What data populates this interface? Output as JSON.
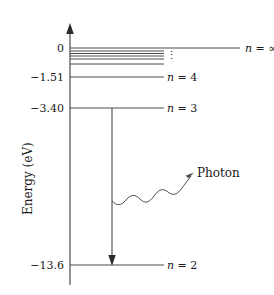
{
  "figure": {
    "type": "energy-level-diagram",
    "axis_title": "Energy (eV)",
    "width": 274,
    "height": 295,
    "line_color": "#4d4d4d",
    "text_color": "#1a1a1a",
    "background": "#ffffff"
  },
  "y_axis": {
    "ticks": [
      {
        "label": "0",
        "value": 0,
        "y": 48
      },
      {
        "label": "−1.51",
        "value": -1.51,
        "y": 77
      },
      {
        "label": "−3.40",
        "value": -3.4,
        "y": 108
      },
      {
        "label": "−13.6",
        "value": -13.6,
        "y": 265
      }
    ]
  },
  "levels": [
    {
      "id": "n-infinity",
      "label": "n = ∞",
      "n": "∞",
      "energy": 0,
      "y": 48,
      "x_end": 240,
      "label_x": 245
    },
    {
      "id": "n-8",
      "label": "",
      "n": 8,
      "energy": -0.21,
      "y": 51,
      "x_end": 164,
      "label_x": null
    },
    {
      "id": "n-7",
      "label": "",
      "n": 7,
      "energy": -0.28,
      "y": 53.5,
      "x_end": 164,
      "label_x": null
    },
    {
      "id": "n-6",
      "label": "",
      "n": 6,
      "energy": -0.38,
      "y": 56,
      "x_end": 164,
      "label_x": null
    },
    {
      "id": "n-5",
      "label": "",
      "n": 5,
      "energy": -0.54,
      "y": 59,
      "x_end": 164,
      "label_x": null
    },
    {
      "id": "n-4",
      "label": "n = 4",
      "n": 4,
      "energy": -0.85,
      "y": 64,
      "x_end": 164,
      "label_x": 167
    },
    {
      "id": "n-3",
      "label": "n = 3",
      "n": 3,
      "energy": -1.51,
      "y": 77,
      "x_end": 164,
      "label_x": 167
    },
    {
      "id": "n-2",
      "label": "n = 2",
      "n": 2,
      "energy": -3.4,
      "y": 108,
      "x_end": 164,
      "label_x": 167
    },
    {
      "id": "n-1",
      "label": "n = 1",
      "n": 1,
      "energy": -13.6,
      "y": 265,
      "x_end": 164,
      "label_x": 167
    }
  ],
  "annotations": {
    "vertical_dots": "⋮",
    "photon_label": "Photon",
    "transition": {
      "from_level": "n-2",
      "to_level": "n-1",
      "direction": "downward",
      "x": 112,
      "y_start": 108,
      "y_end": 265
    }
  },
  "symbols": {
    "n_italic": "n",
    "equals": "=",
    "infinity": "∞",
    "minus": "−"
  }
}
